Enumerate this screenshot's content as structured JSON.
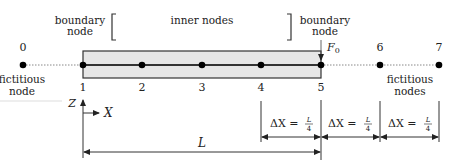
{
  "labels": {
    "boundary_left_line1": "boundary",
    "boundary_left_line2": "node",
    "inner_nodes": "inner nodes",
    "boundary_right_line1": "boundary",
    "boundary_right_line2": "node",
    "fictitious_left_line1": "fictitious",
    "fictitious_left_line2": "node",
    "fictitious_right_line1": "fictitious",
    "fictitious_right_line2": "nodes",
    "force": "F",
    "force_sub": "0",
    "axis_z": "Z",
    "axis_x": "X",
    "length": "L"
  },
  "nodes": [
    {
      "id": "0",
      "x": 23,
      "type": "fictitious"
    },
    {
      "id": "1",
      "x": 83,
      "type": "boundary"
    },
    {
      "id": "2",
      "x": 142,
      "type": "inner"
    },
    {
      "id": "3",
      "x": 202,
      "type": "inner"
    },
    {
      "id": "4",
      "x": 261,
      "type": "inner"
    },
    {
      "id": "5",
      "x": 321,
      "type": "boundary"
    },
    {
      "id": "6",
      "x": 380,
      "type": "fictitious"
    },
    {
      "id": "7",
      "x": 439,
      "type": "fictitious"
    }
  ],
  "spacing": {
    "label_prefix": "ΔX =",
    "frac_num": "L",
    "frac_den": "4",
    "count": 3
  },
  "colors": {
    "bar_fill": "#e6e6e6",
    "line": "#333333",
    "node": "#000000",
    "dotted": "#888888"
  }
}
